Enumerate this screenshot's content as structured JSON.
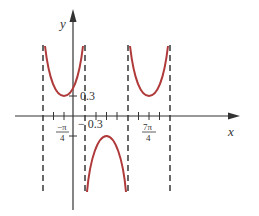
{
  "graph": {
    "x_axis_label": "x",
    "y_axis_label": "y",
    "y_ticks": [
      {
        "label": "0.3",
        "value": 0.3
      },
      {
        "label": "− 0.3",
        "value": -0.3
      }
    ],
    "x_ticks": [
      {
        "num": "−π",
        "den": "4",
        "value": "-pi/4"
      },
      {
        "num": "7π",
        "den": "4",
        "value": "7pi/4"
      }
    ],
    "colors": {
      "curve": "#b03a3a",
      "axis": "#333333",
      "asymptote": "#444444"
    },
    "curve_description": "Secant-type graph with vertical asymptotes; upper branches with minimum 0.3, lower branch with maximum -0.3"
  }
}
